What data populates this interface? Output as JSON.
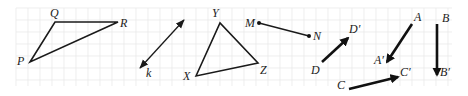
{
  "diagram": {
    "background": "#ffffff",
    "grid": {
      "x0": 16,
      "y0": 8,
      "x1": 452,
      "y1": 86,
      "cell": 12,
      "color": "#e6e6e6"
    },
    "triangle_pqr": {
      "vertices": {
        "P": [
          30,
          62
        ],
        "Q": [
          55,
          22
        ],
        "R": [
          118,
          22
        ]
      },
      "labels": {
        "P": "P",
        "Q": "Q",
        "R": "R"
      }
    },
    "line_k": {
      "from": [
        140,
        68
      ],
      "to": [
        184,
        20
      ],
      "label": "k",
      "double_arrow": true
    },
    "triangle_xyz": {
      "vertices": {
        "X": [
          196,
          76
        ],
        "Y": [
          220,
          23
        ],
        "Z": [
          258,
          63
        ]
      },
      "labels": {
        "X": "X",
        "Y": "Y",
        "Z": "Z"
      }
    },
    "segment_mn": {
      "from": [
        259,
        23
      ],
      "to": [
        309,
        36
      ],
      "labels": {
        "M": "M",
        "N": "N"
      }
    },
    "vector_dd": {
      "from": [
        322,
        62
      ],
      "to": [
        348,
        38
      ],
      "labels": {
        "start": "D",
        "end": "D′"
      }
    },
    "vector_aa": {
      "from": [
        412,
        24
      ],
      "to": [
        387,
        62
      ],
      "labels": {
        "start": "A",
        "end": "A′"
      }
    },
    "vector_bb": {
      "from": [
        437,
        24
      ],
      "to": [
        437,
        75
      ],
      "labels": {
        "start": "B",
        "end": "B′"
      }
    },
    "vector_cc": {
      "from": [
        349,
        89
      ],
      "to": [
        398,
        77
      ],
      "labels": {
        "start": "C",
        "end": "C′"
      }
    }
  }
}
